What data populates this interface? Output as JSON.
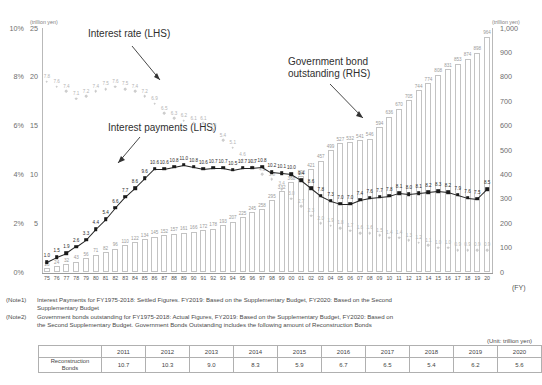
{
  "chart_data": {
    "type": "bar",
    "title": "",
    "xlabel": "(FY)",
    "x": [
      "75",
      "76",
      "77",
      "78",
      "79",
      "80",
      "81",
      "82",
      "83",
      "84",
      "85",
      "86",
      "87",
      "88",
      "89",
      "90",
      "91",
      "92",
      "93",
      "94",
      "95",
      "96",
      "97",
      "98",
      "99",
      "00",
      "01",
      "02",
      "03",
      "04",
      "05",
      "06",
      "07",
      "08",
      "09",
      "10",
      "11",
      "12",
      "13",
      "14",
      "15",
      "16",
      "17",
      "18",
      "19",
      "20"
    ],
    "left_axis": {
      "unit": "(trillion yen)",
      "percent_ticks": [
        "10%",
        "8%",
        "6%",
        "4%",
        "2%",
        "0%"
      ],
      "value_ticks": [
        "25",
        "20",
        "15",
        "10",
        "5",
        ""
      ],
      "ylim": [
        0,
        25
      ],
      "rate_lim": [
        0,
        10
      ]
    },
    "right_axis": {
      "unit": "(trillion yen)",
      "ticks": [
        "1,000",
        "900",
        "800",
        "700",
        "600",
        "500",
        "400",
        "300",
        "200",
        "100",
        "0"
      ],
      "ylim": [
        0,
        1000
      ]
    },
    "series": [
      {
        "name": "Government bond outstanding (RHS)",
        "type": "bar",
        "axis": "right",
        "values": [
          15,
          24,
          32,
          43,
          56,
          71,
          82,
          96,
          110,
          122,
          134,
          145,
          152,
          157,
          161,
          166,
          172,
          178,
          193,
          207,
          225,
          245,
          258,
          295,
          332,
          368,
          392,
          421,
          457,
          499,
          527,
          532,
          541,
          546,
          594,
          636,
          670,
          705,
          744,
          774,
          808,
          831,
          853,
          874,
          898,
          964
        ]
      },
      {
        "name": "Interest payments (LHS)",
        "type": "line",
        "axis": "left",
        "values": [
          1.0,
          1.5,
          1.9,
          2.6,
          3.3,
          4.4,
          5.4,
          6.6,
          7.7,
          8.6,
          9.6,
          10.6,
          10.6,
          10.8,
          11.0,
          10.8,
          10.6,
          10.7,
          10.7,
          10.5,
          10.7,
          10.7,
          10.8,
          10.2,
          10.1,
          10.0,
          9.4,
          8.6,
          7.8,
          7.3,
          7.0,
          7.0,
          7.4,
          7.6,
          7.7,
          7.8,
          8.1,
          8.0,
          8.1,
          8.2,
          8.3,
          8.2,
          7.9,
          7.6,
          7.5,
          8.5
        ]
      },
      {
        "name": "Interest rate (LHS)",
        "type": "scatter",
        "axis": "left_percent",
        "values": [
          7.8,
          7.6,
          7.4,
          7.1,
          7.2,
          7.4,
          7.5,
          7.6,
          7.5,
          7.4,
          7.2,
          6.9,
          6.5,
          6.3,
          6.2,
          6.1,
          6.1,
          5.8,
          5.4,
          5.1,
          4.6,
          4.3,
          4.0,
          3.8,
          3.4,
          3.0,
          2.7,
          2.3,
          2.0,
          1.9,
          1.8,
          1.7,
          1.6,
          1.6,
          1.5,
          1.4,
          1.4,
          1.3,
          1.2,
          1.1,
          1.0,
          1.0,
          0.9,
          0.9,
          0.9,
          0.9
        ]
      }
    ],
    "annotations": [
      {
        "id": "rate",
        "text": "Interest rate (LHS)"
      },
      {
        "id": "payments",
        "text": "Interest payments (LHS)"
      },
      {
        "id": "bond",
        "text": "Government bond outstanding (RHS)"
      }
    ]
  },
  "notes": {
    "note1_tag": "(Note1)",
    "note1_text": "Interest Payments for FY1975-2018: Settled Figures. FY2019: Based on the Supplementary Budget, FY2020: Based on the Second",
    "note1_cont": "Supplementary Budget",
    "note2_tag": "(Note2)",
    "note2_text": "Government bonds outstanding for FY1975-2018: Actual Figures, FY2019: Based on the Supplementary Budget, FY2020: Based on",
    "note2_cont": "the Second Supplementary Budget. Government Bonds Outstanding includes the following amount of Reconstruction Bonds"
  },
  "table": {
    "unit_note": "(Unit: trillion yen)",
    "corner": "",
    "headers": [
      "2011",
      "2012",
      "2013",
      "2014",
      "2015",
      "2016",
      "2017",
      "2018",
      "2019",
      "2020"
    ],
    "row_label_line1": "Reconstruction",
    "row_label_line2": "Bonds",
    "values": [
      "10.7",
      "10.3",
      "9.0",
      "8.3",
      "5.9",
      "6.7",
      "6.5",
      "5.4",
      "6.2",
      "5.6"
    ]
  }
}
